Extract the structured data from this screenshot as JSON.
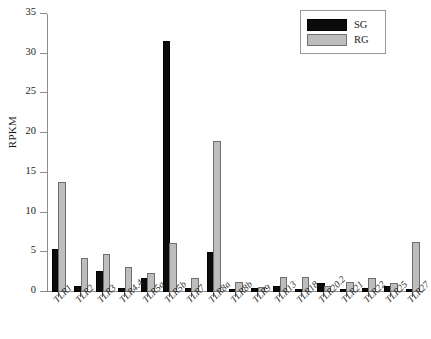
{
  "chart_data": {
    "type": "bar",
    "title": "",
    "xlabel": "",
    "ylabel": "RPKM",
    "ylim": [
      0,
      35
    ],
    "yticks": [
      0,
      5,
      10,
      15,
      20,
      25,
      30,
      35
    ],
    "grid": false,
    "legend_position": "top-right",
    "categories": [
      "TLR1",
      "TLR2",
      "TLR3",
      "TLR4.4",
      "TLR5a",
      "TLR5b",
      "TLR7",
      "TLR8a",
      "TLR8b",
      "TLR9",
      "TLR13",
      "TLR18",
      "TLR20.2",
      "TLR21",
      "TLR22",
      "TLR25",
      "TLR27"
    ],
    "series": [
      {
        "name": "SG",
        "color": "#0b0b0b",
        "values": [
          5.2,
          0.5,
          2.4,
          0.3,
          1.5,
          31.4,
          0.3,
          4.8,
          0.05,
          0.25,
          0.5,
          0.1,
          0.9,
          0.1,
          0.2,
          0.5,
          0.1
        ]
      },
      {
        "name": "RG",
        "color": "#bdbdbd",
        "values": [
          13.6,
          4.0,
          4.5,
          2.9,
          2.1,
          5.9,
          1.5,
          18.8,
          1.0,
          0.4,
          1.6,
          1.6,
          0.5,
          1.0,
          1.5,
          0.9,
          6.1
        ]
      }
    ]
  },
  "legend": {
    "items": [
      {
        "label": "SG",
        "swatch": "sg"
      },
      {
        "label": "RG",
        "swatch": "rg"
      }
    ]
  }
}
